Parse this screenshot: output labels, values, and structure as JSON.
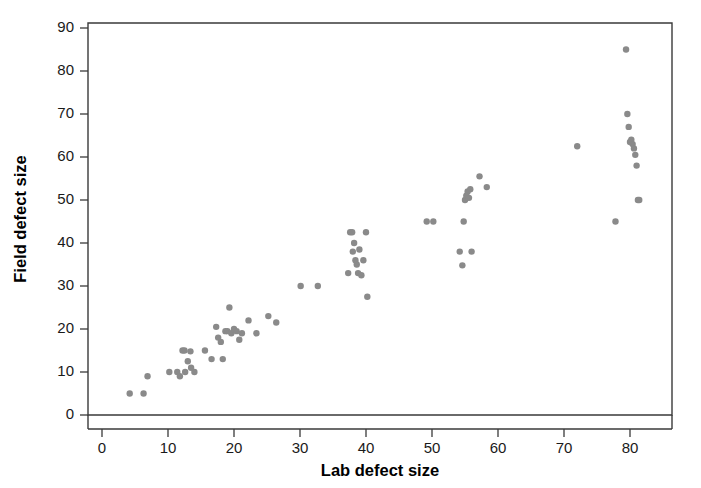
{
  "chart_data": {
    "type": "scatter",
    "title": "",
    "xlabel": "Lab defect size",
    "ylabel": "Field defect size",
    "xlim": [
      -2,
      88
    ],
    "ylim": [
      0,
      92
    ],
    "xticks": [
      0,
      10,
      20,
      30,
      40,
      50,
      60,
      70,
      80
    ],
    "xticklabels": [
      "0",
      "10",
      "20",
      "30",
      "40",
      "50",
      "60",
      "70",
      "80"
    ],
    "yticks": [
      0,
      10,
      20,
      30,
      40,
      50,
      60,
      70,
      80,
      90
    ],
    "yticklabels": [
      "0",
      "10",
      "20",
      "30",
      "40",
      "50",
      "60",
      "70",
      "80",
      "90"
    ],
    "grid": false,
    "legend": null,
    "marker": {
      "shape": "circle",
      "color": "#8a8a8a",
      "size": 6.2
    },
    "series": [
      {
        "name": "defects",
        "x": [
          4.2,
          6.3,
          6.9,
          10.2,
          11.4,
          11.8,
          12.2,
          12.5,
          12.6,
          13.0,
          13.4,
          13.5,
          14.0,
          15.6,
          16.6,
          17.3,
          17.6,
          18.0,
          18.3,
          18.7,
          19.0,
          19.3,
          19.6,
          20.0,
          20.4,
          20.8,
          21.2,
          22.2,
          23.4,
          25.2,
          26.4,
          30.1,
          32.7,
          37.3,
          37.6,
          37.9,
          38.0,
          38.2,
          38.4,
          38.6,
          38.8,
          39.0,
          39.3,
          39.6,
          40.0,
          40.2,
          49.2,
          50.2,
          54.2,
          54.6,
          54.8,
          55.0,
          55.2,
          55.4,
          55.6,
          55.8,
          56.0,
          57.2,
          58.3,
          72.0,
          77.8,
          79.4,
          79.6,
          79.8,
          80.0,
          80.2,
          80.4,
          80.6,
          80.8,
          81.0,
          81.2,
          81.4
        ],
        "y": [
          5.0,
          5.0,
          9.0,
          10.0,
          10.0,
          9.0,
          15.0,
          15.0,
          10.0,
          12.5,
          14.8,
          11.0,
          10.0,
          15.0,
          13.0,
          20.5,
          18.0,
          17.0,
          13.0,
          19.5,
          19.5,
          25.0,
          19.0,
          20.0,
          19.5,
          17.5,
          19.0,
          22.0,
          19.0,
          23.0,
          21.5,
          30.0,
          30.0,
          33.0,
          42.5,
          42.5,
          38.0,
          40.0,
          36.0,
          35.0,
          33.0,
          38.5,
          32.5,
          36.0,
          42.5,
          27.5,
          45.0,
          45.0,
          38.0,
          34.8,
          45.0,
          50.0,
          51.0,
          52.0,
          50.5,
          52.5,
          38.0,
          55.5,
          53.0,
          62.5,
          45.0,
          85.0,
          70.0,
          67.0,
          63.5,
          64.0,
          63.0,
          62.0,
          60.5,
          58.0,
          50.0,
          50.0
        ]
      }
    ]
  },
  "axis": {
    "x_title": "Lab defect size",
    "y_title": "Field defect size"
  }
}
